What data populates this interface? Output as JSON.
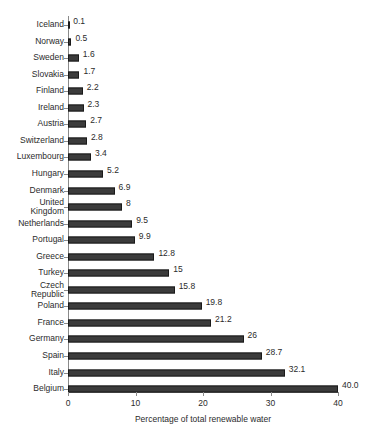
{
  "chart_data": {
    "type": "bar",
    "orientation": "horizontal",
    "title": "",
    "xlabel": "Percentage of total renewable water",
    "ylabel": "",
    "xlim": [
      0,
      40
    ],
    "xticks": [
      0,
      10,
      20,
      30,
      40
    ],
    "xtick_labels": [
      "0",
      "10",
      "20",
      "30",
      "40"
    ],
    "grid": false,
    "legend": null,
    "bar_color": "#3b3b3b",
    "categories": [
      "Iceland",
      "Norway",
      "Sweden",
      "Slovakia",
      "Finland",
      "Ireland",
      "Austria",
      "Switzerland",
      "Luxembourg",
      "Hungary",
      "Denmark",
      "United\nKingdom",
      "Netherlands",
      "Portugal",
      "Greece",
      "Turkey",
      "Czech\nRepublic",
      "Poland",
      "France",
      "Germany",
      "Spain",
      "Italy",
      "Belgium"
    ],
    "values": [
      0.1,
      0.5,
      1.6,
      1.7,
      2.2,
      2.3,
      2.7,
      2.8,
      3.4,
      5.2,
      6.9,
      8,
      9.5,
      9.9,
      12.8,
      15,
      15.8,
      19.8,
      21.2,
      26,
      28.7,
      32.1,
      40.0
    ],
    "data_labels": [
      "0.1",
      "0.5",
      "1.6",
      "1.7",
      "2.2",
      "2.3",
      "2.7",
      "2.8",
      "3.4",
      "5.2",
      "6.9",
      "8",
      "9.5",
      "9.9",
      "12.8",
      "15",
      "15.8",
      "19.8",
      "21.2",
      "26",
      "28.7",
      "32.1",
      "40.0"
    ]
  }
}
